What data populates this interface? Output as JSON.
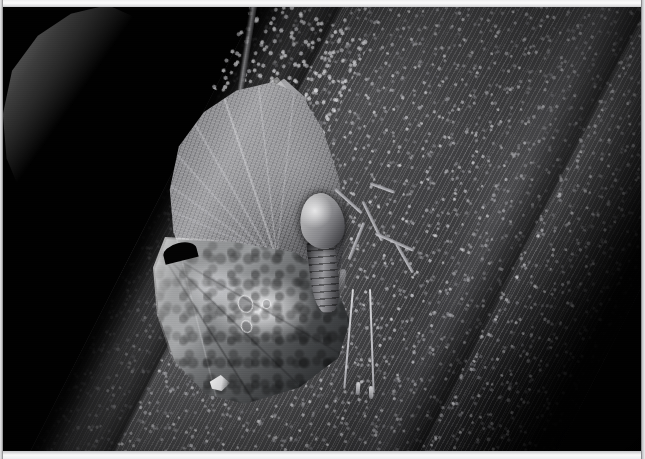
{
  "image": {
    "title": "Leaf-mimic butterfly resting on a tree trunk",
    "medium": "black-and-white photograph",
    "width_px": "645",
    "height_px": "459",
    "orientation": "landscape",
    "lighting": "direct flash against a black background",
    "background_color": "#000000",
    "border_color": "#f7f7f8"
  },
  "subjects": {
    "butterfly": {
      "label": "leaf-mimic butterfly",
      "pose": "wings closed, head upward, clinging to bark",
      "parts": {
        "forewing_label": "forewing with leaf-vein pattern",
        "wing_apex_label": "pointed wing apex resembling a leaf tip",
        "hindwing_label": "hindwing with bright white patch",
        "thorax_label": "pale bulbous thorax",
        "abdomen_label": "segmented abdomen",
        "legs_label": "thin pale legs gripping bark",
        "antennae_label": "two long clubbed antennae",
        "eyespots_label": "small pale ring markings"
      },
      "tones": {
        "wing_light": "#a2a2a5",
        "wing_mid": "#6e6e70",
        "wing_dark": "#2a2a2c",
        "white_patch": "#ffffff",
        "thorax_highlight": "#c9c9ca"
      }
    },
    "tree_trunk": {
      "label": "tree trunk running diagonally from upper-left to lower-right",
      "texture": "rough granular bark with lichen speckles",
      "angle_degrees": "27",
      "tones": {
        "bark_light": "#4a4a4c",
        "bark_mid": "#2a2a2b",
        "bark_dark": "#0a0a0a",
        "lichen_speckle": "#f5f5f8"
      }
    },
    "twig": {
      "label": "thin twig crossing the upper trunk"
    }
  },
  "composition": {
    "background_label": "black background",
    "vignette_label": "dark vignette",
    "film_grain_label": "film grain",
    "border_label": "light photographic border"
  }
}
